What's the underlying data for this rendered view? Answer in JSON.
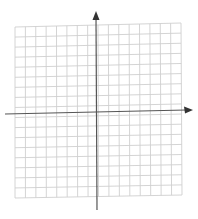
{
  "diagram": {
    "type": "coordinate-grid",
    "grid": {
      "columns": 16,
      "rows": 17,
      "origin_column": 8,
      "origin_row": 9
    },
    "axes": {
      "x_axis": {
        "arrow": "right",
        "label": ""
      },
      "y_axis": {
        "arrow": "up",
        "label": ""
      }
    },
    "colors": {
      "grid_line": "#cfcfcf",
      "axis_line": "#555555",
      "background": "#ffffff"
    }
  }
}
